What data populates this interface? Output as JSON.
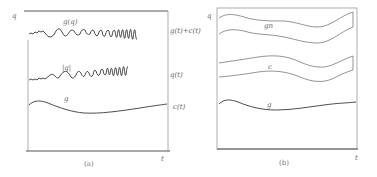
{
  "figure": {
    "panels": [
      {
        "id": "a",
        "caption": "(a)",
        "y_axis_label": "q",
        "x_axis_label": "t",
        "curves": [
          {
            "name": "g(q)",
            "inline_label": "g(q)",
            "right_label": "g(t)+c(t)",
            "style": "oscillating, increasing frequency"
          },
          {
            "name": "|q|",
            "inline_label": "|q|",
            "right_label": "q(t)",
            "style": "oscillating, increasing frequency"
          },
          {
            "name": "g",
            "inline_label": "g",
            "right_label": "c(t)",
            "style": "smooth slow drift"
          }
        ]
      },
      {
        "id": "b",
        "caption": "(b)",
        "y_axis_label": "q",
        "x_axis_label": "t",
        "bands": [
          {
            "name": "gn",
            "inline_label": "gn"
          },
          {
            "name": "c",
            "inline_label": "c"
          }
        ],
        "curves": [
          {
            "name": "g",
            "inline_label": "g"
          }
        ]
      }
    ]
  }
}
